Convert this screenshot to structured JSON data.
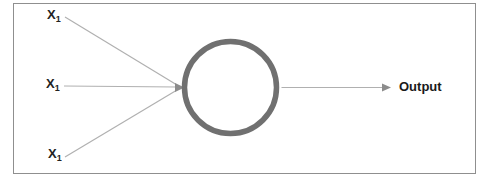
{
  "diagram": {
    "type": "single-neuron-perceptron",
    "inputs": [
      {
        "base": "X",
        "sub": "1"
      },
      {
        "base": "X",
        "sub": "1"
      },
      {
        "base": "X",
        "sub": "1"
      }
    ],
    "node": {
      "shape": "circle"
    },
    "output": {
      "label": "Output"
    },
    "colors": {
      "background": "#ffffff",
      "frame_border": "#8f8f8f",
      "node_ring": "#707070",
      "node_fill": "#ffffff",
      "connector_line": "#b0b0b0",
      "arrowhead": "#8c8c8c",
      "label_text": "#222222",
      "output_text": "#1a1a1a"
    }
  }
}
